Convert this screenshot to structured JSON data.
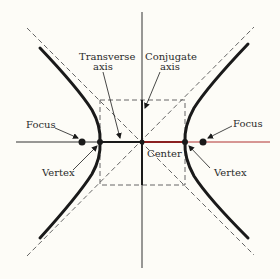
{
  "diagram": {
    "colors": {
      "background": "#fdfcf7",
      "ink": "#1a1a1a",
      "axis_accent": "#b03030",
      "dashed": "#555555"
    },
    "labels": {
      "transverse_axis_line1": "Transverse",
      "transverse_axis_line2": "axis",
      "conjugate_axis_line1": "Conjugate",
      "conjugate_axis_line2": "axis",
      "focus_left": "Focus",
      "focus_right": "Focus",
      "vertex_left": "Vertex",
      "vertex_right": "Vertex",
      "center": "Center"
    },
    "elements": [
      "hyperbola-left-branch",
      "hyperbola-right-branch",
      "asymptote-1",
      "asymptote-2",
      "fundamental-rectangle",
      "transverse-axis",
      "conjugate-axis",
      "foci",
      "vertices",
      "center"
    ]
  }
}
